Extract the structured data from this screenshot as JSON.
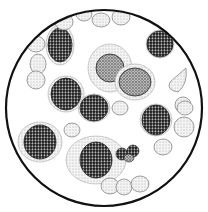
{
  "figure": {
    "colors": {
      "background": "#ffffff",
      "outline": "#111111",
      "dark_nucleus": "#2a2a2a",
      "mid_cell": "#6e6e6e",
      "light_cell": "#c8c8c8"
    },
    "field": {
      "cx": 104,
      "cy": 108,
      "r": 98
    },
    "red_cells": [
      {
        "cx": 64,
        "cy": 22,
        "rx": 9,
        "ry": 8
      },
      {
        "cx": 84,
        "cy": 14,
        "rx": 8,
        "ry": 7
      },
      {
        "cx": 101,
        "cy": 20,
        "rx": 9,
        "ry": 7
      },
      {
        "cx": 121,
        "cy": 17,
        "rx": 9,
        "ry": 8
      },
      {
        "cx": 38,
        "cy": 64,
        "rx": 8,
        "ry": 10
      },
      {
        "cx": 36,
        "cy": 80,
        "rx": 9,
        "ry": 9
      },
      {
        "cx": 36,
        "cy": 44,
        "rx": 9,
        "ry": 8
      },
      {
        "cx": 72,
        "cy": 130,
        "rx": 8,
        "ry": 7
      },
      {
        "cx": 120,
        "cy": 108,
        "rx": 8,
        "ry": 7
      },
      {
        "cx": 183,
        "cy": 105,
        "rx": 8,
        "ry": 8
      },
      {
        "cx": 184,
        "cy": 127,
        "rx": 10,
        "ry": 10
      },
      {
        "cx": 163,
        "cy": 147,
        "rx": 9,
        "ry": 8
      },
      {
        "cx": 110,
        "cy": 186,
        "rx": 9,
        "ry": 8
      },
      {
        "cx": 124,
        "cy": 187,
        "rx": 8,
        "ry": 8
      },
      {
        "cx": 140,
        "cy": 184,
        "rx": 9,
        "ry": 8
      },
      {
        "cx": 185,
        "cy": 108,
        "rx": 8,
        "ry": 7
      }
    ],
    "white_cells": [
      {
        "cx": 60,
        "cy": 45,
        "rx": 14,
        "ry": 20,
        "nucleus_rx": 12,
        "nucleus_ry": 17,
        "shade": "dark"
      },
      {
        "cx": 110,
        "cy": 68,
        "rx": 22,
        "ry": 24,
        "nucleus_rx": 14,
        "nucleus_ry": 14,
        "shade": "mid"
      },
      {
        "cx": 135,
        "cy": 82,
        "rx": 20,
        "ry": 18,
        "nucleus_rx": 16,
        "nucleus_ry": 14,
        "shade": "mid"
      },
      {
        "cx": 66,
        "cy": 94,
        "rx": 18,
        "ry": 18,
        "nucleus_rx": 15,
        "nucleus_ry": 16,
        "shade": "dark"
      },
      {
        "cx": 94,
        "cy": 108,
        "rx": 16,
        "ry": 14,
        "nucleus_rx": 14,
        "nucleus_ry": 13,
        "shade": "dark"
      },
      {
        "cx": 40,
        "cy": 142,
        "rx": 22,
        "ry": 20,
        "nucleus_rx": 16,
        "nucleus_ry": 17,
        "shade": "dark"
      },
      {
        "cx": 96,
        "cy": 160,
        "rx": 30,
        "ry": 24,
        "nucleus_rx": 16,
        "nucleus_ry": 18,
        "shade": "dark"
      },
      {
        "cx": 156,
        "cy": 120,
        "rx": 16,
        "ry": 16,
        "nucleus_rx": 14,
        "nucleus_ry": 15,
        "shade": "dark"
      },
      {
        "cx": 160,
        "cy": 44,
        "rx": 14,
        "ry": 14,
        "nucleus_rx": 13,
        "nucleus_ry": 13,
        "shade": "dark"
      }
    ],
    "platelet_cluster": {
      "cx": 128,
      "cy": 154,
      "rx": 14,
      "ry": 9
    },
    "teardrop_cell": {
      "cx": 178,
      "cy": 80,
      "rx": 10,
      "ry": 13
    }
  }
}
